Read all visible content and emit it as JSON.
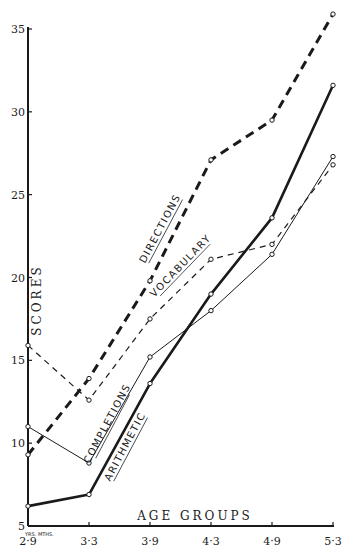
{
  "chart_data": {
    "type": "line",
    "title": "",
    "xlabel": "AGE GROUPS",
    "ylabel": "SCORES",
    "x_note": "YRS. MTHS.",
    "categories": [
      "2-9",
      "3-3",
      "3-9",
      "4-3",
      "4-9",
      "5-3"
    ],
    "category_labels": [
      "2·9",
      "3·3",
      "3·9",
      "4·3",
      "4·9",
      "5·3"
    ],
    "ylim": [
      5,
      35
    ],
    "yticks": [
      5,
      10,
      15,
      20,
      25,
      30,
      35
    ],
    "grid": false,
    "legend": "inline labels along lines",
    "series": [
      {
        "name": "DIRECTIONS",
        "style": "heavy-dashed",
        "values": [
          9.3,
          13.9,
          19.8,
          27.1,
          29.5,
          35.9
        ]
      },
      {
        "name": "VOCABULARY",
        "style": "light-dashed",
        "values": [
          15.9,
          12.6,
          17.5,
          21.1,
          22.0,
          26.8
        ]
      },
      {
        "name": "COMPLETIONS",
        "style": "light-solid",
        "values": [
          11.0,
          8.8,
          15.2,
          18.0,
          21.4,
          27.3
        ]
      },
      {
        "name": "ARITHMETIC",
        "style": "heavy-solid",
        "values": [
          6.2,
          6.9,
          13.6,
          19.0,
          23.6,
          31.6
        ]
      }
    ]
  },
  "colors": {
    "ink": "#1a1a1a",
    "paper": "#ffffff"
  }
}
